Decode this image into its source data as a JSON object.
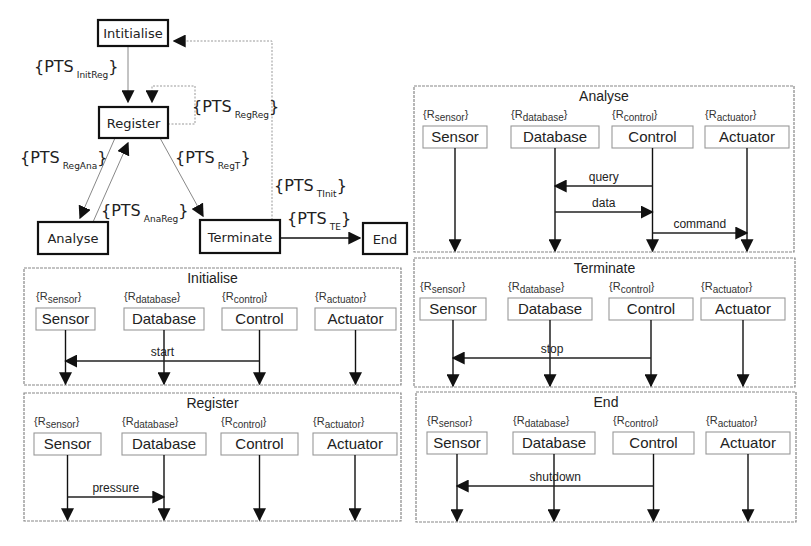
{
  "state_machine": {
    "states": [
      {
        "id": "init",
        "label": "Intitialise",
        "x": 98,
        "y": 20,
        "w": 70,
        "h": 26
      },
      {
        "id": "register",
        "label": "Register",
        "x": 99,
        "y": 107,
        "w": 69,
        "h": 31
      },
      {
        "id": "analyse",
        "label": "Analyse",
        "x": 38,
        "y": 222,
        "w": 70,
        "h": 32
      },
      {
        "id": "terminate",
        "label": "Terminate",
        "x": 200,
        "y": 220,
        "w": 80,
        "h": 33
      },
      {
        "id": "end",
        "label": "End",
        "x": 363,
        "y": 223,
        "w": 44,
        "h": 31
      }
    ],
    "transitions": [
      {
        "id": "InitReg",
        "label": "PTS",
        "sub": "InitReg",
        "lx": 34,
        "ly": 72
      },
      {
        "id": "RegReg",
        "label": "PTS",
        "sub": "RegReg",
        "lx": 192,
        "ly": 112
      },
      {
        "id": "RegAna",
        "label": "PTS",
        "sub": "RegAna",
        "lx": 20,
        "ly": 163
      },
      {
        "id": "RegT",
        "label": "PTS",
        "sub": "RegT",
        "lx": 175,
        "ly": 163
      },
      {
        "id": "AnaReg",
        "label": "PTS",
        "sub": "AnaReg",
        "lx": 101,
        "ly": 216
      },
      {
        "id": "TInit",
        "label": "PTS",
        "sub": "TInit",
        "lx": 274,
        "ly": 191
      },
      {
        "id": "TE",
        "label": "PTS",
        "sub": "TE",
        "lx": 287,
        "ly": 224
      }
    ]
  },
  "roles": [
    {
      "name": "Sensor",
      "tag": "R",
      "tag_sub": "sensor"
    },
    {
      "name": "Database",
      "tag": "R",
      "tag_sub": "database"
    },
    {
      "name": "Control",
      "tag": "R",
      "tag_sub": "control"
    },
    {
      "name": "Actuator",
      "tag": "R",
      "tag_sub": "actuator"
    }
  ],
  "panels": [
    {
      "title": "Initialise",
      "x": 24,
      "y": 268,
      "w": 377,
      "h": 117,
      "role_x": [
        36,
        124,
        222,
        315
      ],
      "role_w": [
        59,
        80,
        75,
        81
      ],
      "messages": [
        {
          "label": "start",
          "from": 2,
          "to": 0,
          "y": 361
        }
      ]
    },
    {
      "title": "Register",
      "x": 24,
      "y": 393,
      "w": 377,
      "h": 128,
      "role_x": [
        34,
        122,
        221,
        313
      ],
      "role_w": [
        67,
        84,
        77,
        84
      ],
      "messages": [
        {
          "label": "pressure",
          "from": 0,
          "to": 1,
          "y": 497
        }
      ]
    },
    {
      "title": "Analyse",
      "x": 414,
      "y": 86,
      "w": 380,
      "h": 166,
      "role_x": [
        423,
        511,
        612,
        705
      ],
      "role_w": [
        64,
        88,
        81,
        84
      ],
      "messages": [
        {
          "label": "query",
          "from": 2,
          "to": 1,
          "y": 186
        },
        {
          "label": "data",
          "from": 1,
          "to": 2,
          "y": 212
        },
        {
          "label": "command",
          "from": 2,
          "to": 3,
          "y": 233
        }
      ]
    },
    {
      "title": "Terminate",
      "x": 414,
      "y": 258,
      "w": 381,
      "h": 129,
      "role_x": [
        420,
        508,
        609,
        701
      ],
      "role_w": [
        66,
        84,
        84,
        84
      ],
      "messages": [
        {
          "label": "stop",
          "from": 2,
          "to": 0,
          "y": 358
        }
      ]
    },
    {
      "title": "End",
      "x": 416,
      "y": 392,
      "w": 380,
      "h": 130,
      "role_x": [
        427,
        513,
        613,
        706
      ],
      "role_w": [
        60,
        82,
        81,
        84
      ],
      "messages": [
        {
          "label": "shutdown",
          "from": 2,
          "to": 0,
          "y": 486
        }
      ]
    }
  ]
}
